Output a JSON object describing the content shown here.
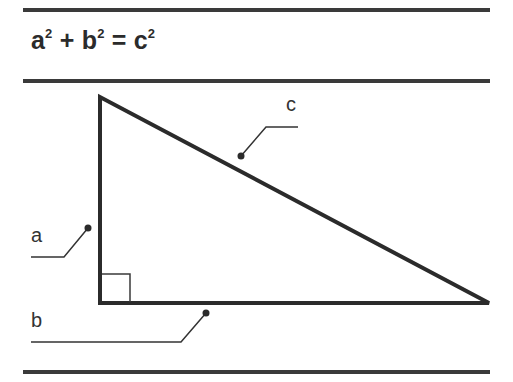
{
  "formula": {
    "a": "a",
    "a_exp": "2",
    "plus": "+",
    "b": "b",
    "b_exp": "2",
    "equals": "=",
    "c": "c",
    "c_exp": "2"
  },
  "labels": {
    "hypotenuse": "c",
    "vertical_leg": "a",
    "horizontal_leg": "b"
  },
  "colors": {
    "stroke": "#2b2b2b",
    "background": "#ffffff"
  }
}
